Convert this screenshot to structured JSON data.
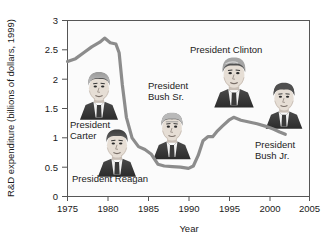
{
  "chart_data": {
    "type": "line",
    "title": "",
    "xlabel": "Year",
    "ylabel": "R&D expenditure (billions of dollars, 1999)",
    "xlim": [
      1975,
      2005
    ],
    "ylim": [
      0,
      3
    ],
    "grid": false,
    "legend": "none",
    "xticks": [
      "1975",
      "1980",
      "1985",
      "1990",
      "1995",
      "2000",
      "2005"
    ],
    "yticks": [
      "0",
      "0.5",
      "1",
      "1.5",
      "2",
      "2.5",
      "3"
    ],
    "series": [
      {
        "name": "R&D expenditure",
        "color": "#8c8c8c",
        "x": [
          1975,
          1976,
          1977,
          1978,
          1979,
          1979.6,
          1980.3,
          1981,
          1981.4,
          1981.8,
          1982.3,
          1983,
          1983.8,
          1984.6,
          1985.4,
          1986.2,
          1987,
          1988,
          1989,
          1990,
          1990.6,
          1991.2,
          1991.8,
          1992.4,
          1993,
          1993.6,
          1994.2,
          1995,
          1995.6,
          1996.5,
          1997.5,
          1998.5,
          1999.5,
          2000.5,
          2001.3,
          2002
        ],
        "y": [
          2.3,
          2.35,
          2.45,
          2.55,
          2.63,
          2.7,
          2.62,
          2.6,
          2.45,
          1.9,
          1.35,
          1.0,
          0.85,
          0.8,
          0.72,
          0.55,
          0.52,
          0.51,
          0.5,
          0.48,
          0.52,
          0.7,
          0.95,
          1.02,
          1.02,
          1.12,
          1.2,
          1.3,
          1.35,
          1.3,
          1.27,
          1.24,
          1.2,
          1.15,
          1.1,
          1.06
        ]
      }
    ],
    "annotations": [
      {
        "key": "carter",
        "label_lines": [
          "President",
          "Carter"
        ],
        "text_x_pct": 6,
        "text_y_pct": 48,
        "portrait_x_pct": 17,
        "portrait_y_pct": 26
      },
      {
        "key": "reagan",
        "label_lines": [
          "President Reagan"
        ],
        "text_x_pct": 10,
        "text_y_pct": 72,
        "portrait_x_pct": 26,
        "portrait_y_pct": 48
      },
      {
        "key": "bush_sr",
        "label_lines": [
          "President",
          "Bush Sr."
        ],
        "text_x_pct": 42,
        "text_y_pct": 33,
        "portrait_x_pct": 47,
        "portrait_y_pct": 45
      },
      {
        "key": "clinton",
        "label_lines": [
          "President Clinton"
        ],
        "text_x_pct": 58,
        "text_y_pct": 17,
        "portrait_x_pct": 68,
        "portrait_y_pct": 25
      },
      {
        "key": "bush_jr",
        "label_lines": [
          "President",
          "Bush Jr."
        ],
        "text_x_pct": 78,
        "text_y_pct": 57,
        "portrait_x_pct": 83,
        "portrait_y_pct": 33
      }
    ]
  },
  "axes": {
    "ylabel": "R&D expenditure (billions of dollars, 1999)",
    "xlabel": "Year",
    "ytick_0": "0",
    "ytick_1": "0.5",
    "ytick_2": "1",
    "ytick_3": "1.5",
    "ytick_4": "2",
    "ytick_5": "2.5",
    "ytick_6": "3",
    "xtick_0": "1975",
    "xtick_1": "1980",
    "xtick_2": "1985",
    "xtick_3": "1990",
    "xtick_4": "1995",
    "xtick_5": "2000",
    "xtick_6": "2005"
  },
  "labels": {
    "carter_line1": "President",
    "carter_line2": "Carter",
    "reagan_line1": "President Reagan",
    "bush_sr_line1": "President",
    "bush_sr_line2": "Bush Sr.",
    "clinton_line1": "President Clinton",
    "bush_jr_line1": "President",
    "bush_jr_line2": "Bush Jr."
  },
  "portraits": {
    "carter_name": "president-carter-portrait",
    "reagan_name": "president-reagan-portrait",
    "bush_sr_name": "president-bush-sr-portrait",
    "clinton_name": "president-clinton-portrait",
    "bush_jr_name": "president-bush-jr-portrait"
  },
  "colors": {
    "line": "#8c8c8c",
    "axis": "#4d4d4d",
    "text": "#1a1a1a",
    "plot_bg": "#fbfbfb",
    "page_bg": "#ffffff"
  }
}
